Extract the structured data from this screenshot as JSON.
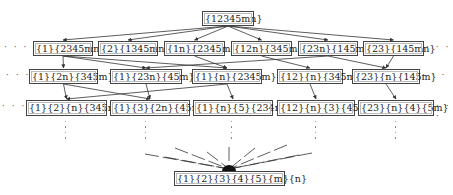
{
  "diagram": {
    "title": "",
    "top": {
      "id": "t",
      "label": "{12345mn}",
      "x": 202,
      "y": 11,
      "w": 52,
      "h": 15
    },
    "rows": [
      [
        {
          "id": "r1a",
          "label": "{1}{2345mn}",
          "x": 33,
          "y": 41,
          "w": 60,
          "h": 15
        },
        {
          "id": "r1b",
          "label": "{2}{1345mn}",
          "x": 98,
          "y": 41,
          "w": 60,
          "h": 15
        },
        {
          "id": "r1c",
          "label": "{1n}{2345m}",
          "x": 164,
          "y": 41,
          "w": 61,
          "h": 15
        },
        {
          "id": "r1d",
          "label": "{12n}{345m}",
          "x": 231,
          "y": 41,
          "w": 61,
          "h": 15
        },
        {
          "id": "r1e",
          "label": "{23n}{145m}",
          "x": 298,
          "y": 41,
          "w": 60,
          "h": 15
        },
        {
          "id": "r1f",
          "label": "{23}{145mn}",
          "x": 363,
          "y": 41,
          "w": 61,
          "h": 15
        }
      ],
      [
        {
          "id": "r2a",
          "label": "{1}{2n}{345m}",
          "x": 29,
          "y": 69,
          "w": 69,
          "h": 15
        },
        {
          "id": "r2b",
          "label": "{1}{23n}{45m}",
          "x": 110,
          "y": 69,
          "w": 72,
          "h": 15
        },
        {
          "id": "r2c",
          "label": "{1}{n}{2345m}",
          "x": 192,
          "y": 69,
          "w": 70,
          "h": 15
        },
        {
          "id": "r2d",
          "label": "{12}{n}{345m}",
          "x": 277,
          "y": 69,
          "w": 66,
          "h": 15
        },
        {
          "id": "r2e",
          "label": "{23}{n}{145m}",
          "x": 352,
          "y": 69,
          "w": 68,
          "h": 15
        }
      ],
      [
        {
          "id": "r3a",
          "label": "{1}{2}{n}{345m}",
          "x": 26,
          "y": 100,
          "w": 81,
          "h": 16
        },
        {
          "id": "r3b",
          "label": "{1}{3}{2n}{45m}",
          "x": 110,
          "y": 100,
          "w": 80,
          "h": 16
        },
        {
          "id": "r3c",
          "label": "{1}{n}{5}{234m}",
          "x": 193,
          "y": 100,
          "w": 80,
          "h": 16
        },
        {
          "id": "r3d",
          "label": "{12}{n}{3}{45m}",
          "x": 277,
          "y": 100,
          "w": 78,
          "h": 16
        },
        {
          "id": "r3e",
          "label": "{23}{n}{4}{5m}",
          "x": 358,
          "y": 100,
          "w": 76,
          "h": 16
        }
      ]
    ],
    "bottom": {
      "id": "b",
      "label": "{1}{2}{3}{4}{5}{m}{n}",
      "x": 174,
      "y": 171,
      "w": 111,
      "h": 15
    },
    "ellipsis": "· · ·",
    "edges": [
      [
        "t",
        "r1a"
      ],
      [
        "t",
        "r1b"
      ],
      [
        "t",
        "r1c"
      ],
      [
        "t",
        "r1d"
      ],
      [
        "t",
        "r1e"
      ],
      [
        "t",
        "r1f"
      ],
      [
        "r1a",
        "r2a"
      ],
      [
        "r1a",
        "r2b"
      ],
      [
        "r1a",
        "r2c"
      ],
      [
        "r1c",
        "r2c"
      ],
      [
        "r1d",
        "r2d"
      ],
      [
        "r1e",
        "r2b"
      ],
      [
        "r1e",
        "r2e"
      ],
      [
        "r1f",
        "r2e"
      ],
      [
        "r2a",
        "r3a"
      ],
      [
        "r2a",
        "r3b"
      ],
      [
        "r2b",
        "r3b"
      ],
      [
        "r2c",
        "r3a"
      ],
      [
        "r2c",
        "r3c"
      ],
      [
        "r2d",
        "r3d"
      ],
      [
        "r2e",
        "r3e"
      ]
    ],
    "fan_rays_from": [
      [
        145,
        154
      ],
      [
        165,
        157
      ],
      [
        175,
        148
      ],
      [
        207,
        152
      ],
      [
        229,
        147
      ],
      [
        255,
        148
      ],
      [
        287,
        145
      ],
      [
        299,
        155
      ],
      [
        312,
        153
      ]
    ],
    "fan_center": [
      229,
      169
    ],
    "colors": {
      "line": "#333333",
      "border": "#444444",
      "text": "#222222"
    }
  }
}
